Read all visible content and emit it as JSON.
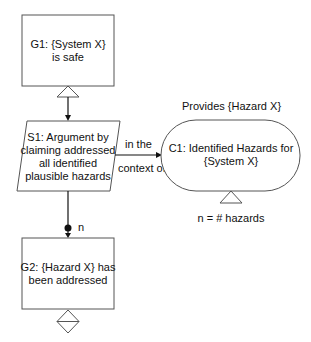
{
  "diagram": {
    "type": "goal-structuring-notation",
    "nodes": {
      "g1": {
        "kind": "goal",
        "lines": [
          "G1: {System X}",
          "is safe"
        ],
        "decorator": "uninstantiated-triangle"
      },
      "s1": {
        "kind": "strategy",
        "lines": [
          "S1: Argument by",
          "claiming addressed",
          "all identified",
          "plausible hazards"
        ]
      },
      "c1": {
        "kind": "context",
        "lines": [
          "C1: Identified Hazards for",
          "{System X}"
        ],
        "decorator": "uninstantiated-triangle",
        "above_label": "Provides {Hazard X}",
        "below_label": "n = # hazards"
      },
      "g2": {
        "kind": "goal",
        "lines": [
          "G2: {Hazard X} has",
          "been addressed"
        ],
        "decorator": "undeveloped-uninstantiated-diamond"
      }
    },
    "edges": [
      {
        "from": "g1",
        "to": "s1",
        "kind": "supported-by",
        "label": ""
      },
      {
        "from": "s1",
        "to": "c1",
        "kind": "in-context-of",
        "label_top": "in the",
        "label_bottom": "context of"
      },
      {
        "from": "s1",
        "to": "g2",
        "kind": "supported-by",
        "multiplicity": "n"
      }
    ]
  }
}
